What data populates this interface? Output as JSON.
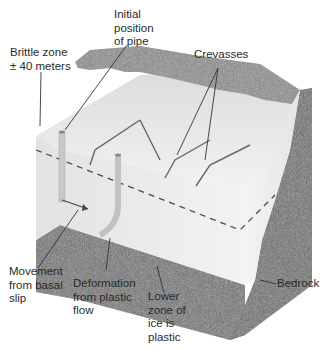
{
  "diagram": {
    "labels": {
      "initial_position": "Initial\nposition\nof pipe",
      "brittle_zone": "Brittle zone\n± 40 meters",
      "crevasses": "Crevasses",
      "basal_slip": "Movement\nfrom basal\nslip",
      "plastic_flow": "Deformation\nfrom plastic\nflow",
      "lower_zone": "Lower\nzone of\nice is\nplastic",
      "bedrock": "Bedrock"
    },
    "colors": {
      "ice_top": "#e6e6e6",
      "ice_front": "#ececec",
      "ice_side": "#f4f4f4",
      "snow_band": "#8c8c8c",
      "bedrock": "#6f6f6f",
      "leader": "#333333",
      "dashed_line": "#555555"
    }
  }
}
